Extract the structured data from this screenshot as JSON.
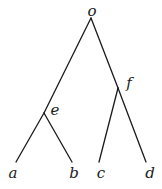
{
  "diagram": {
    "type": "tree",
    "nodes": [
      {
        "id": "o",
        "label": "o",
        "role": "root",
        "x": 91,
        "y": 18,
        "lx": 92,
        "ly": 16
      },
      {
        "id": "e",
        "label": "e",
        "role": "internal",
        "x": 44,
        "y": 113,
        "lx": 55,
        "ly": 115
      },
      {
        "id": "f",
        "label": "f",
        "role": "internal",
        "x": 118,
        "y": 88,
        "lx": 129,
        "ly": 88
      },
      {
        "id": "a",
        "label": "a",
        "role": "leaf",
        "x": 16,
        "y": 162,
        "lx": 13,
        "ly": 178
      },
      {
        "id": "b",
        "label": "b",
        "role": "leaf",
        "x": 72,
        "y": 162,
        "lx": 74,
        "ly": 178
      },
      {
        "id": "c",
        "label": "c",
        "role": "leaf",
        "x": 99,
        "y": 162,
        "lx": 101,
        "ly": 178
      },
      {
        "id": "d",
        "label": "d",
        "role": "leaf",
        "x": 146,
        "y": 162,
        "lx": 150,
        "ly": 178
      }
    ],
    "edges": [
      {
        "from": "o",
        "to": "e"
      },
      {
        "from": "e",
        "to": "a"
      },
      {
        "from": "e",
        "to": "b"
      },
      {
        "from": "o",
        "to": "f"
      },
      {
        "from": "f",
        "to": "c"
      },
      {
        "from": "f",
        "to": "d"
      }
    ]
  }
}
